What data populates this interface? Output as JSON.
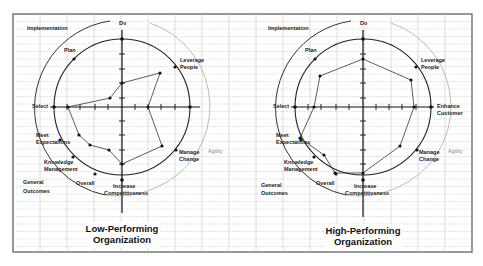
{
  "figure": {
    "frame": {
      "x": 13,
      "y": 14,
      "width": 459,
      "height": 238
    },
    "colors": {
      "grid": "#c8c8c8",
      "frame": "#777777",
      "axis": "#111111",
      "circle": "#222222",
      "outer_arc_dark": "#333333",
      "outer_arc_light": "#aaaaaa",
      "data_line": "#333333",
      "text": "#222222"
    }
  },
  "panels": [
    {
      "id": "low",
      "title_line1": "Low-Performing",
      "title_line2": "Organization",
      "center": [
        122,
        107
      ],
      "radius": 68,
      "outer_radius": 88,
      "labels": {
        "implementation": "Implementation",
        "do": "Do",
        "plan": "Plan",
        "leverage_1": "Leverage",
        "leverage_2": "People",
        "select": "Select",
        "enhance_1": "",
        "enhance_2": "",
        "meet_1": "Meet",
        "meet_2": "Expectations",
        "knowledge_1": "Knowledge",
        "knowledge_2": "Management",
        "general_1": "General",
        "general_2": "Outcomes",
        "overall": "Overall",
        "increase_1": "Increase",
        "increase_2": "Competitiveness",
        "manage_1": "Manage",
        "manage_2": "Change",
        "agility": "Agility"
      },
      "data_points": [
        [
          122,
          83
        ],
        [
          160,
          73
        ],
        [
          148,
          107
        ],
        [
          162,
          146
        ],
        [
          122,
          164
        ],
        [
          109,
          150
        ],
        [
          90,
          145
        ],
        [
          79,
          135
        ],
        [
          68,
          107
        ],
        [
          110,
          98
        ]
      ]
    },
    {
      "id": "high",
      "title_line1": "High-Performing",
      "title_line2": "Organization",
      "center": [
        363,
        107
      ],
      "radius": 68,
      "outer_radius": 88,
      "labels": {
        "implementation": "Implementation",
        "do": "Do",
        "plan": "Plan",
        "leverage_1": "Leverage",
        "leverage_2": "People",
        "select": "Select",
        "enhance_1": "Enhance",
        "enhance_2": "Customer",
        "meet_1": "Meet",
        "meet_2": "Expectations",
        "knowledge_1": "Knowledge",
        "knowledge_2": "Management",
        "general_1": "General",
        "general_2": "Outcomes",
        "overall": "Overall",
        "increase_1": "Increase",
        "increase_2": "Competitiveness",
        "manage_1": "Manage",
        "manage_2": "Change",
        "agility": "Agility"
      },
      "data_points": [
        [
          363,
          59
        ],
        [
          411,
          80
        ],
        [
          414,
          107
        ],
        [
          400,
          146
        ],
        [
          363,
          173
        ],
        [
          335,
          173
        ],
        [
          324,
          155
        ],
        [
          300,
          138
        ],
        [
          314,
          107
        ],
        [
          320,
          76
        ]
      ]
    }
  ]
}
